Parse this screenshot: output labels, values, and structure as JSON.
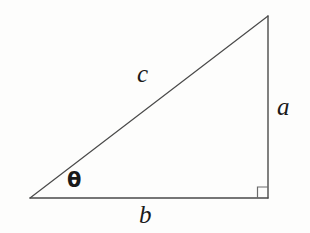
{
  "figure": {
    "name": "right-triangle-trigonometry-diagram",
    "background_color": "#fdfdfc",
    "stroke_color": "#4a4a4a",
    "text_color": "#1a1a1a",
    "canvas": {
      "width": 310,
      "height": 233
    }
  },
  "geometry": {
    "vertices": {
      "angle_vertex": {
        "x": 30,
        "y": 198
      },
      "right_angle_vertex": {
        "x": 268,
        "y": 198
      },
      "apex_vertex": {
        "x": 268,
        "y": 16
      }
    },
    "sides": {
      "base": {
        "label": "b",
        "from": "angle_vertex",
        "to": "right_angle_vertex"
      },
      "vertical": {
        "label": "a",
        "from": "right_angle_vertex",
        "to": "apex_vertex"
      },
      "hypotenuse": {
        "label": "c",
        "from": "angle_vertex",
        "to": "apex_vertex"
      }
    },
    "right_angle_marker": {
      "x": 257,
      "y": 187,
      "size": 11
    }
  },
  "labels": {
    "hypotenuse": "c",
    "opposite": "a",
    "adjacent": "b",
    "angle": "θ"
  }
}
